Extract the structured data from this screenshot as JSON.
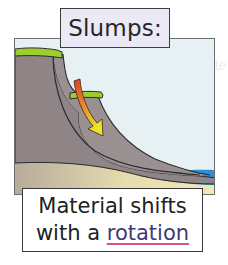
{
  "title": "Slumps:",
  "caption": {
    "line1": "Material shifts",
    "line2_prefix": "with a ",
    "keyword": "rotation"
  },
  "background_ghost_text": [
    "The climate",
    "The land",
    "and s"
  ],
  "diagram": {
    "elements": [
      "cliff",
      "grass-top",
      "slip-surface",
      "slump-block-grass",
      "movement-arrow",
      "beach-sand",
      "sea-water"
    ],
    "colors": {
      "sky": "#e7f0f3",
      "rock": "#8f8486",
      "rock_dark": "#7b7073",
      "grass": "#9ccf2c",
      "sand": "#efe6b0",
      "water": "#2f8fd6",
      "arrow_start": "#e2452a",
      "arrow_end": "#e8e42a",
      "outline": "#2b2b2b",
      "keyword": "#3e3a78",
      "keyword_underline": "#d5548a"
    }
  }
}
